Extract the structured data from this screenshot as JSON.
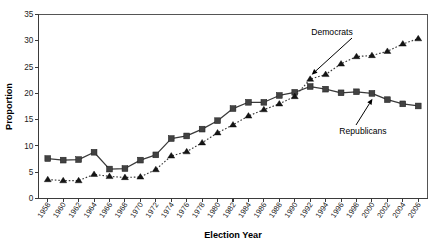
{
  "figure": {
    "width": 442,
    "height": 249,
    "background": "#ffffff"
  },
  "axes": {
    "x_title": "Election Year",
    "y_title": "Proportion"
  },
  "annotations": {
    "democrats_label": "Democrats",
    "republicans_label": "Republicans"
  },
  "chart_data": {
    "type": "line",
    "title": "",
    "subtitle": "",
    "xlabel": "Election Year",
    "ylabel": "Proportion",
    "xlim": [
      1957,
      2007
    ],
    "ylim": [
      0,
      35
    ],
    "y_ticks": [
      0,
      5,
      10,
      15,
      20,
      25,
      30,
      35
    ],
    "grid": false,
    "legend": "none",
    "annotations": [
      {
        "text": "Democrats",
        "points_to_series": "Democrats",
        "points_to_x": 1992
      },
      {
        "text": "Republicans",
        "points_to_series": "Republicans",
        "points_to_x": 2000
      }
    ],
    "categories": [
      "1958",
      "1960",
      "1962",
      "1964",
      "1966",
      "1968",
      "1970",
      "1972",
      "1974",
      "1976",
      "1978",
      "1980",
      "1982",
      "1984",
      "1986",
      "1988",
      "1990",
      "1992",
      "1994",
      "1996",
      "1998",
      "2000",
      "2002",
      "2004",
      "2006"
    ],
    "x": [
      1958,
      1960,
      1962,
      1964,
      1966,
      1968,
      1970,
      1972,
      1974,
      1976,
      1978,
      1980,
      1982,
      1984,
      1986,
      1988,
      1990,
      1992,
      1994,
      1996,
      1998,
      2000,
      2002,
      2004,
      2006
    ],
    "series": [
      {
        "name": "Republicans",
        "marker": "square",
        "linestyle": "solid",
        "color": "#3a3a3a",
        "values": [
          7.6,
          7.3,
          7.4,
          8.8,
          5.6,
          5.7,
          7.3,
          8.3,
          11.4,
          11.9,
          13.2,
          14.8,
          17.1,
          18.3,
          18.3,
          19.6,
          20.2,
          21.3,
          20.8,
          20.1,
          20.3,
          20.0,
          18.8,
          18.0,
          17.6
        ]
      },
      {
        "name": "Democrats",
        "marker": "triangle",
        "linestyle": "dotted",
        "color": "#151515",
        "values": [
          3.6,
          3.4,
          3.4,
          4.6,
          4.2,
          4.0,
          4.1,
          5.5,
          8.1,
          8.9,
          10.6,
          12.5,
          14.0,
          15.7,
          16.9,
          18.0,
          19.4,
          22.7,
          23.6,
          25.6,
          27.0,
          27.2,
          28.0,
          29.4,
          30.4
        ]
      }
    ]
  }
}
